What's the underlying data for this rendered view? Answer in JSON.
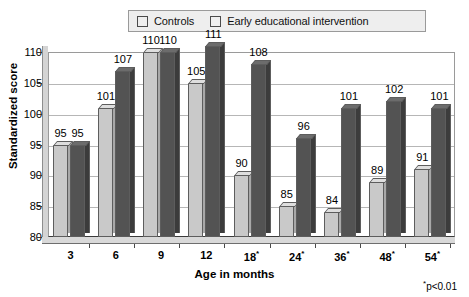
{
  "chart_data": {
    "type": "bar",
    "title": "",
    "xlabel": "Age in months",
    "ylabel": "Standardized score",
    "ylim": [
      80,
      110
    ],
    "yticks": [
      80,
      85,
      90,
      95,
      100,
      105,
      110
    ],
    "grid": true,
    "legend_position": "top",
    "categories": [
      "3",
      "6",
      "9",
      "12",
      "18*",
      "24*",
      "36*",
      "48*",
      "54*"
    ],
    "series": [
      {
        "name": "Controls",
        "color": "#c9c9c9",
        "values": [
          95,
          101,
          110,
          105,
          90,
          85,
          84,
          89,
          91
        ]
      },
      {
        "name": "Early educational intervention",
        "color": "#535353",
        "values": [
          95,
          107,
          110,
          111,
          108,
          96,
          101,
          102,
          101
        ]
      }
    ],
    "annotations": [
      "*p<0.01"
    ]
  },
  "legend": {
    "entries": [
      {
        "label": "Controls"
      },
      {
        "label": "Early educational intervention"
      }
    ]
  },
  "axes": {
    "y_title": "Standardized score",
    "x_title": "Age in months",
    "y_tick_labels": [
      "110",
      "105",
      "100",
      "95",
      "90",
      "85",
      "80"
    ],
    "x_tick_labels": [
      "3",
      "6",
      "9",
      "12",
      "18",
      "24",
      "36",
      "48",
      "54"
    ],
    "x_tick_markers": [
      "",
      "",
      "",
      "",
      "*",
      "*",
      "*",
      "*",
      "*"
    ]
  },
  "footnote": {
    "marker": "*",
    "text": "p<0.01"
  },
  "colors": {
    "controls": "#c9c9c9",
    "intervention": "#535353",
    "gridline": "#b6b6b6",
    "frame": "#9a9a9a",
    "legend_bg": "#eeeeee",
    "floor": "#d9d9d9"
  }
}
